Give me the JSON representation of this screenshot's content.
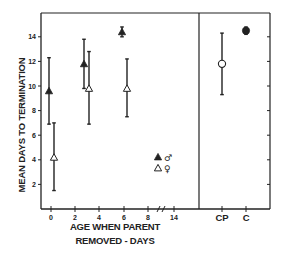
{
  "chart_data": {
    "type": "scatter",
    "title": "",
    "xlabel_lines": [
      "AGE WHEN PARENT",
      "REMOVED - DAYS"
    ],
    "ylabel": "MEAN DAYS TO TERMINATION",
    "ylim": [
      0,
      16
    ],
    "yticks": [
      2,
      4,
      6,
      8,
      10,
      12,
      14
    ],
    "ytick_labels": [
      "2",
      "4",
      "6",
      "8",
      "10",
      "12",
      "14"
    ],
    "xticks": [
      "0",
      "2",
      "4",
      "6",
      "8",
      "14"
    ],
    "x_break_between": [
      "8",
      "14"
    ],
    "control_panel_categories": [
      "CP",
      "C"
    ],
    "grid": false,
    "legend": {
      "position": "inside lower right of left panel",
      "entries": [
        {
          "marker": "filled-triangle",
          "symbol": "♂",
          "label": "male"
        },
        {
          "marker": "open-triangle",
          "symbol": "♀",
          "label": "female"
        }
      ]
    },
    "series": [
      {
        "name": "♂",
        "marker": "filled-triangle",
        "points": [
          {
            "x": "0",
            "y": 9.6,
            "err_low": 6.9,
            "err_high": 12.3
          },
          {
            "x": "3",
            "y": 11.8,
            "err_low": 9.8,
            "err_high": 13.8
          },
          {
            "x": "6",
            "y": 14.4,
            "err_low": 14.0,
            "err_high": 14.8
          }
        ]
      },
      {
        "name": "♀",
        "marker": "open-triangle",
        "points": [
          {
            "x": "0",
            "y": 4.2,
            "err_low": 1.5,
            "err_high": 7.0
          },
          {
            "x": "3",
            "y": 9.8,
            "err_low": 6.9,
            "err_high": 12.8
          },
          {
            "x": "6",
            "y": 9.8,
            "err_low": 7.5,
            "err_high": 12.2
          }
        ]
      },
      {
        "name": "CP",
        "marker": "open-circle",
        "points": [
          {
            "x": "CP",
            "y": 11.8,
            "err_low": 9.3,
            "err_high": 14.3
          }
        ]
      },
      {
        "name": "C",
        "marker": "filled-circle",
        "points": [
          {
            "x": "C",
            "y": 14.5,
            "err_low": 14.2,
            "err_high": 14.8
          }
        ]
      }
    ]
  }
}
